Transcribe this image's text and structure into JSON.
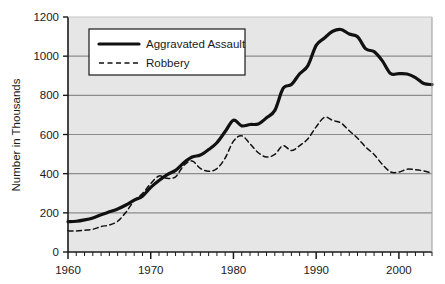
{
  "chart_data": {
    "type": "line",
    "title": "",
    "xlabel": "",
    "ylabel": "Number in Thousands",
    "xlim": [
      1960,
      2004
    ],
    "ylim": [
      0,
      1200
    ],
    "ytick_labels": [
      "0",
      "200",
      "400",
      "600",
      "800",
      "1000",
      "1200"
    ],
    "ytick_values": [
      0,
      200,
      400,
      600,
      800,
      1000,
      1200
    ],
    "xtick_labels": [
      "1960",
      "1970",
      "1980",
      "1990",
      "2000"
    ],
    "xtick_values": [
      1960,
      1970,
      1980,
      1990,
      2000
    ],
    "minor_xtick_interval": 1,
    "grid": "horizontal",
    "legend_position": "upper-left-inside",
    "plot_background": "#e6e6e6",
    "grid_color": "#8c8c8c",
    "axis_color": "#1a1a1a",
    "series": [
      {
        "name": "Aggravated Assault",
        "style": "solid",
        "color": "#111111",
        "width": 3.2,
        "x": [
          1960,
          1961,
          1962,
          1963,
          1964,
          1965,
          1966,
          1967,
          1968,
          1969,
          1970,
          1971,
          1972,
          1973,
          1974,
          1975,
          1976,
          1977,
          1978,
          1979,
          1980,
          1981,
          1982,
          1983,
          1984,
          1985,
          1986,
          1987,
          1988,
          1989,
          1990,
          1991,
          1992,
          1993,
          1994,
          1995,
          1996,
          1997,
          1998,
          1999,
          2000,
          2001,
          2002,
          2003,
          2004
        ],
        "values": [
          155,
          157,
          164,
          174,
          190,
          205,
          220,
          240,
          265,
          285,
          330,
          365,
          395,
          417,
          456,
          485,
          495,
          523,
          558,
          615,
          673,
          644,
          651,
          654,
          685,
          723,
          835,
          855,
          910,
          952,
          1055,
          1093,
          1127,
          1136,
          1113,
          1099,
          1037,
          1023,
          976,
          911,
          911,
          909,
          891,
          860,
          855
        ]
      },
      {
        "name": "Robbery",
        "style": "dashed",
        "color": "#111111",
        "width": 1.5,
        "x": [
          1960,
          1961,
          1962,
          1963,
          1964,
          1965,
          1966,
          1967,
          1968,
          1969,
          1970,
          1971,
          1972,
          1973,
          1974,
          1975,
          1976,
          1977,
          1978,
          1979,
          1980,
          1981,
          1982,
          1983,
          1984,
          1985,
          1986,
          1987,
          1988,
          1989,
          1990,
          1991,
          1992,
          1993,
          1994,
          1995,
          1996,
          1997,
          1998,
          1999,
          2000,
          2001,
          2002,
          2003,
          2004
        ],
        "values": [
          108,
          107,
          111,
          116,
          130,
          138,
          157,
          203,
          262,
          298,
          349,
          388,
          376,
          384,
          442,
          465,
          427,
          412,
          426,
          480,
          566,
          593,
          553,
          507,
          485,
          498,
          543,
          518,
          543,
          578,
          639,
          688,
          672,
          659,
          619,
          581,
          535,
          498,
          447,
          409,
          408,
          423,
          420,
          414,
          402
        ]
      }
    ],
    "annotations": {
      "assault_peak_year": 1993,
      "assault_peak_value": 1136,
      "robbery_peak_year": 1991,
      "robbery_peak_value": 688
    }
  },
  "legend": {
    "entries": [
      {
        "label": "Aggravated Assault",
        "style": "solid"
      },
      {
        "label": "Robbery",
        "style": "dashed"
      }
    ]
  }
}
